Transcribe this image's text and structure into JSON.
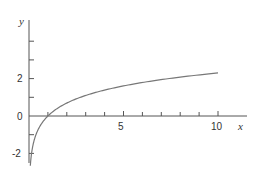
{
  "chart_data": {
    "type": "line",
    "title": "",
    "xlabel": "x",
    "ylabel": "y",
    "function": "y = ln(x)",
    "xlim": [
      0,
      10.5
    ],
    "ylim": [
      -2.6,
      5
    ],
    "x_ticks": [
      1,
      2,
      3,
      4,
      5,
      6,
      7,
      8,
      9,
      10
    ],
    "x_tick_labels": {
      "5": "5",
      "10": "10"
    },
    "y_ticks": [
      -2,
      -1,
      1,
      2,
      3,
      4
    ],
    "y_tick_labels": {
      "-2": "-2",
      "0": "0",
      "2": "2"
    },
    "grid": false,
    "legend": null,
    "series": [
      {
        "name": "ln x",
        "x": [
          0.07,
          0.1,
          0.15,
          0.2,
          0.3,
          0.5,
          0.75,
          1,
          1.5,
          2,
          3,
          4,
          5,
          6,
          7,
          8,
          9,
          10
        ],
        "values": [
          -2.66,
          -2.3,
          -1.9,
          -1.61,
          -1.2,
          -0.69,
          -0.29,
          0,
          0.41,
          0.69,
          1.1,
          1.39,
          1.61,
          1.79,
          1.95,
          2.08,
          2.2,
          2.3
        ]
      }
    ],
    "colors": {
      "axis": "#555555",
      "curve": "#777777",
      "text": "#333333"
    }
  },
  "labels": {
    "x_axis": "x",
    "y_axis": "y",
    "x5": "5",
    "x10": "10",
    "y0": "0",
    "y2": "2",
    "yneg2": "-2"
  }
}
